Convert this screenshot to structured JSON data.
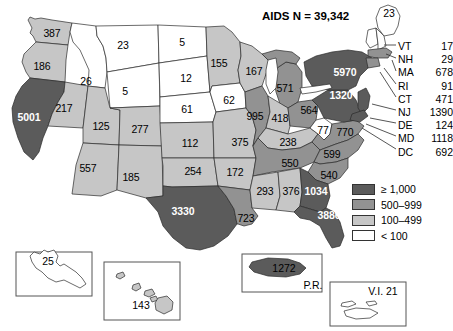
{
  "title": "AIDS N = 39,342",
  "map": {
    "type": "choropleth",
    "region": "United States",
    "measure": "AIDS cases",
    "total": 39342
  },
  "legend": {
    "title": "",
    "items": [
      {
        "label": "≥ 1,000",
        "color": "#5b5b5b",
        "level": 4
      },
      {
        "label": "500–999",
        "color": "#929292",
        "level": 3
      },
      {
        "label": "100–499",
        "color": "#c6c6c6",
        "level": 2
      },
      {
        "label": "< 100",
        "color": "#ffffff",
        "level": 1
      }
    ]
  },
  "states": [
    {
      "abbr": "WA",
      "value": "387",
      "level": 2,
      "x": 52,
      "y": 33
    },
    {
      "abbr": "OR",
      "value": "186",
      "level": 2,
      "x": 42,
      "y": 66
    },
    {
      "abbr": "CA",
      "value": "5001",
      "level": 4,
      "x": 29,
      "y": 117
    },
    {
      "abbr": "NV",
      "value": "217",
      "level": 2,
      "x": 64,
      "y": 108
    },
    {
      "abbr": "ID",
      "value": "26",
      "level": 1,
      "x": 86,
      "y": 81
    },
    {
      "abbr": "MT",
      "value": "23",
      "level": 1,
      "x": 123,
      "y": 45
    },
    {
      "abbr": "WY",
      "value": "5",
      "level": 1,
      "x": 125,
      "y": 91
    },
    {
      "abbr": "UT",
      "value": "125",
      "level": 2,
      "x": 101,
      "y": 126
    },
    {
      "abbr": "AZ",
      "value": "557",
      "level": 2,
      "x": 88,
      "y": 168
    },
    {
      "abbr": "CO",
      "value": "277",
      "level": 2,
      "x": 140,
      "y": 129
    },
    {
      "abbr": "NM",
      "value": "185",
      "level": 2,
      "x": 131,
      "y": 177
    },
    {
      "abbr": "ND",
      "value": "5",
      "level": 1,
      "x": 182,
      "y": 42
    },
    {
      "abbr": "SD",
      "value": "12",
      "level": 1,
      "x": 186,
      "y": 78
    },
    {
      "abbr": "NE",
      "value": "61",
      "level": 1,
      "x": 187,
      "y": 109
    },
    {
      "abbr": "KS",
      "value": "112",
      "level": 2,
      "x": 190,
      "y": 143
    },
    {
      "abbr": "OK",
      "value": "254",
      "level": 2,
      "x": 193,
      "y": 171
    },
    {
      "abbr": "TX",
      "value": "3330",
      "level": 4,
      "x": 183,
      "y": 211
    },
    {
      "abbr": "MN",
      "value": "155",
      "level": 2,
      "x": 219,
      "y": 63
    },
    {
      "abbr": "IA",
      "value": "62",
      "level": 1,
      "x": 229,
      "y": 100
    },
    {
      "abbr": "MO",
      "value": "375",
      "level": 2,
      "x": 240,
      "y": 142
    },
    {
      "abbr": "AR",
      "value": "172",
      "level": 2,
      "x": 235,
      "y": 172
    },
    {
      "abbr": "LA",
      "value": "723",
      "level": 3,
      "x": 246,
      "y": 218
    },
    {
      "abbr": "WI",
      "value": "167",
      "level": 2,
      "x": 254,
      "y": 71
    },
    {
      "abbr": "IL",
      "value": "995",
      "level": 3,
      "x": 255,
      "y": 116
    },
    {
      "abbr": "MS",
      "value": "293",
      "level": 2,
      "x": 265,
      "y": 191
    },
    {
      "abbr": "MI",
      "value": "571",
      "level": 3,
      "x": 285,
      "y": 88
    },
    {
      "abbr": "IN",
      "value": "418",
      "level": 2,
      "x": 280,
      "y": 118
    },
    {
      "abbr": "KY",
      "value": "238",
      "level": 2,
      "x": 288,
      "y": 142
    },
    {
      "abbr": "TN",
      "value": "550",
      "level": 3,
      "x": 290,
      "y": 163
    },
    {
      "abbr": "AL",
      "value": "376",
      "level": 2,
      "x": 291,
      "y": 191
    },
    {
      "abbr": "OH",
      "value": "564",
      "level": 3,
      "x": 309,
      "y": 110
    },
    {
      "abbr": "WV",
      "value": "77",
      "level": 1,
      "x": 323,
      "y": 130
    },
    {
      "abbr": "GA",
      "value": "1034",
      "level": 4,
      "x": 316,
      "y": 191
    },
    {
      "abbr": "FL",
      "value": "3886",
      "level": 4,
      "x": 329,
      "y": 215
    },
    {
      "abbr": "SC",
      "value": "540",
      "level": 3,
      "x": 329,
      "y": 175
    },
    {
      "abbr": "NC",
      "value": "599",
      "level": 3,
      "x": 332,
      "y": 154
    },
    {
      "abbr": "VA",
      "value": "770",
      "level": 3,
      "x": 345,
      "y": 132
    },
    {
      "abbr": "PA",
      "value": "1320",
      "level": 4,
      "x": 341,
      "y": 95
    },
    {
      "abbr": "NY",
      "value": "5970",
      "level": 4,
      "x": 345,
      "y": 72
    },
    {
      "abbr": "ME",
      "value": "23",
      "level": 1,
      "x": 389,
      "y": 13
    }
  ],
  "northeast_list": [
    {
      "abbr": "VT",
      "value": "17"
    },
    {
      "abbr": "NH",
      "value": "29"
    },
    {
      "abbr": "MA",
      "value": "678"
    },
    {
      "abbr": "RI",
      "value": "91"
    },
    {
      "abbr": "CT",
      "value": "471"
    },
    {
      "abbr": "NJ",
      "value": "1390"
    },
    {
      "abbr": "DE",
      "value": "124"
    },
    {
      "abbr": "MD",
      "value": "1118"
    },
    {
      "abbr": "DC",
      "value": "692"
    }
  ],
  "insets": [
    {
      "name": "Alaska",
      "label": "",
      "value": "25",
      "level": 1,
      "vx": 48,
      "vy": 261
    },
    {
      "name": "Hawaii",
      "label": "",
      "value": "143",
      "level": 2,
      "vx": 141,
      "vy": 305
    },
    {
      "name": "Puerto Rico",
      "label": "P.R.",
      "value": "1272",
      "level": 4,
      "vx": 284,
      "vy": 268,
      "lx": 313,
      "ly": 285
    },
    {
      "name": "Virgin Islands",
      "label": "V.I. 21",
      "value": "21",
      "level": 1,
      "lx": 383,
      "ly": 291
    }
  ]
}
